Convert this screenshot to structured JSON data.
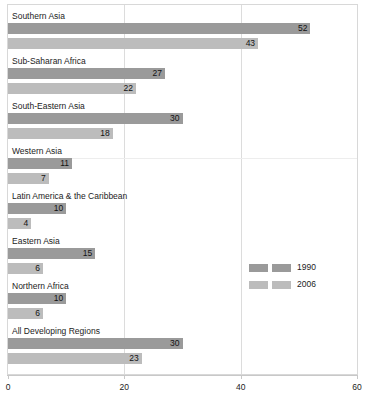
{
  "chart_data": {
    "type": "bar",
    "orientation": "horizontal",
    "title": "",
    "subtitle": "",
    "xlabel": "",
    "ylabel": "",
    "xlim": [
      0,
      60
    ],
    "xticks": [
      0,
      20,
      40,
      60
    ],
    "xtick_labels": [
      "0",
      "20",
      "40",
      "60"
    ],
    "grid": "vertical",
    "legend_position": "middle-right",
    "categories": [
      "Southern Asia",
      "Sub-Saharan Africa",
      "South-Eastern Asia",
      "Western Asia",
      "Latin America & the Caribbean",
      "Eastern Asia",
      "Northern Africa",
      "All Developing Regions"
    ],
    "series": [
      {
        "name": "1990",
        "color": "#9a9a9a",
        "values": [
          52,
          27,
          30,
          11,
          10,
          15,
          10,
          30
        ]
      },
      {
        "name": "2006",
        "color": "#bcbcbc",
        "values": [
          43,
          22,
          18,
          7,
          4,
          6,
          6,
          23
        ]
      }
    ]
  },
  "legend": {
    "items": [
      {
        "label": "1990",
        "color": "#9a9a9a"
      },
      {
        "label": "2006",
        "color": "#bcbcbc"
      }
    ]
  }
}
